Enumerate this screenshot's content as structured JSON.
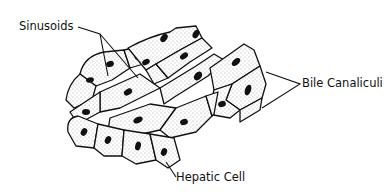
{
  "diagram": {
    "labels": {
      "sinusoids": "Sinusoids",
      "bile_canaliculi": "Bile Canaliculi",
      "hepatic_cell": "Hepatic Cell"
    },
    "colors": {
      "background": "#ffffff",
      "ink": "#111111",
      "stipple": "#555555"
    }
  }
}
